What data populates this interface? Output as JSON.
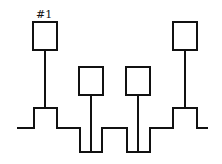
{
  "diagram": {
    "label": "#1",
    "label_position": {
      "x": 36,
      "y": 18
    },
    "stroke_color": "#111111",
    "background": "#ffffff",
    "waveform_points": [
      [
        17,
        128
      ],
      [
        34,
        128
      ],
      [
        34,
        108
      ],
      [
        57,
        108
      ],
      [
        57,
        128
      ],
      [
        80,
        128
      ],
      [
        80,
        152
      ],
      [
        102,
        152
      ],
      [
        102,
        128
      ],
      [
        127,
        128
      ],
      [
        127,
        152
      ],
      [
        150,
        152
      ],
      [
        150,
        128
      ],
      [
        173,
        128
      ],
      [
        173,
        108
      ],
      [
        197,
        108
      ],
      [
        197,
        128
      ],
      [
        208,
        128
      ]
    ],
    "boxes": [
      {
        "id": "1",
        "x": 33,
        "y": 22,
        "w": 24,
        "h": 28,
        "stem_x": 45,
        "stem_y2": 108
      },
      {
        "id": "2",
        "x": 79,
        "y": 67,
        "w": 24,
        "h": 28,
        "stem_x": 91,
        "stem_y2": 152
      },
      {
        "id": "3",
        "x": 126,
        "y": 67,
        "w": 24,
        "h": 28,
        "stem_x": 138,
        "stem_y2": 152
      },
      {
        "id": "4",
        "x": 173,
        "y": 22,
        "w": 24,
        "h": 28,
        "stem_x": 185,
        "stem_y2": 108
      }
    ]
  }
}
